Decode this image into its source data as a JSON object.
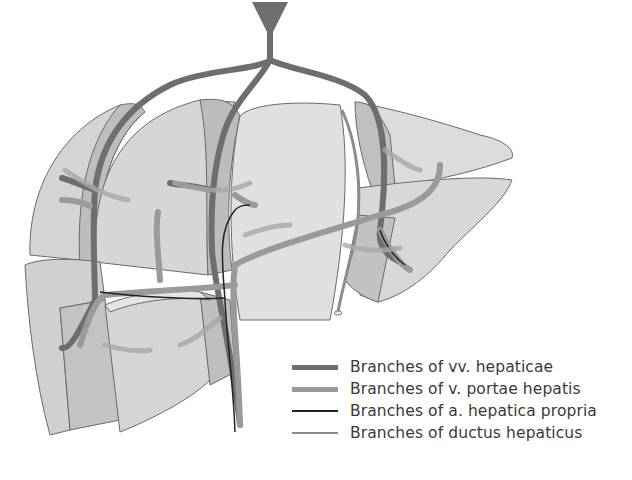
{
  "figure": {
    "colors": {
      "lobe_fill": "#d9d9d9",
      "lobe_face": "#c2c2c2",
      "lobe_light": "#e6e6e6",
      "outline": "#6a6a6a",
      "hepatic_vein": "#6e6e6e",
      "portal_vein": "#9a9a9a",
      "hepatic_artery": "#222222",
      "bile_duct": "#8c8c8c"
    }
  },
  "legend": {
    "items": [
      {
        "label": "Branches of vv. hepaticae",
        "style": "thick-dark"
      },
      {
        "label": "Branches of v. portae hepatis",
        "style": "thick-light"
      },
      {
        "label": "Branches of a. hepatica propria",
        "style": "thin-black"
      },
      {
        "label": "Branches of ductus hepaticus",
        "style": "thin-gray"
      }
    ]
  }
}
